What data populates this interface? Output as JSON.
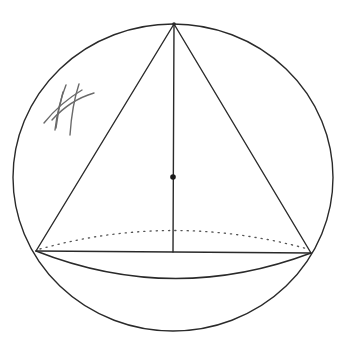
{
  "diagram": {
    "title": "",
    "colors": {
      "line": "#2a2a2a",
      "dotted": "#555555",
      "scribble": "#6a6a6a",
      "background": "#ffffff"
    },
    "sphere": {
      "cx": 173,
      "cy": 177.5,
      "rx": 160,
      "ry": 153.5
    },
    "cone": {
      "apex": [
        174,
        24
      ],
      "base_left": [
        36,
        251
      ],
      "base_right": [
        311,
        253
      ],
      "axis_foot": [
        173,
        252
      ],
      "base_front_arc_depth_y": 278,
      "base_back_arc_top_y": 227
    },
    "center_point": [
      173,
      177
    ],
    "annotations": {
      "scribble_mark": "handwritten hatch mark (illegible)"
    }
  }
}
